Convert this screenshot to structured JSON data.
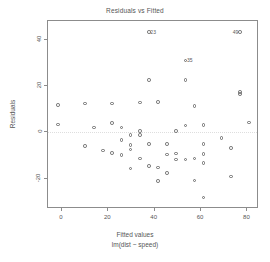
{
  "chart_data": {
    "type": "scatter",
    "title": "Residuals vs Fitted",
    "xlabel_line1": "Fitted values",
    "xlabel_line2": "lm(dist ~ speed)",
    "ylabel": "Residuals",
    "xlim": [
      -6,
      85
    ],
    "ylim": [
      -33,
      48
    ],
    "xticks": [
      0,
      20,
      40,
      60,
      80
    ],
    "yticks": [
      40,
      20,
      0,
      -20
    ],
    "xtick_labels": [
      "0",
      "20",
      "40",
      "60",
      "80"
    ],
    "ytick_labels": [
      "40",
      "20",
      "0",
      "-20"
    ],
    "grid": false,
    "legend": "none",
    "zero_reference_line": 0,
    "marker": "open-circle",
    "marker_color": "#6b6b6b",
    "points": [
      {
        "x": -1.8,
        "y": 11.8
      },
      {
        "x": -1.8,
        "y": 3.4
      },
      {
        "x": 9.9,
        "y": 12.4
      },
      {
        "x": 9.9,
        "y": -5.8
      },
      {
        "x": 13.9,
        "y": 2.1
      },
      {
        "x": 17.8,
        "y": -7.8
      },
      {
        "x": 21.7,
        "y": 12.4
      },
      {
        "x": 21.7,
        "y": 4.0
      },
      {
        "x": 21.7,
        "y": -8.9
      },
      {
        "x": 25.7,
        "y": 2.2
      },
      {
        "x": 25.7,
        "y": -3.2
      },
      {
        "x": 25.7,
        "y": -9.7
      },
      {
        "x": 29.6,
        "y": -1.2
      },
      {
        "x": 29.6,
        "y": -5.5
      },
      {
        "x": 29.6,
        "y": -7.3
      },
      {
        "x": 29.6,
        "y": -15.6
      },
      {
        "x": 33.6,
        "y": 12.8
      },
      {
        "x": 33.6,
        "y": 0.6
      },
      {
        "x": 33.6,
        "y": -1.0
      },
      {
        "x": 33.6,
        "y": -11.3
      },
      {
        "x": 37.5,
        "y": 43.2
      },
      {
        "x": 37.5,
        "y": 22.5
      },
      {
        "x": 37.5,
        "y": -5.1
      },
      {
        "x": 37.5,
        "y": -14.6
      },
      {
        "x": 41.4,
        "y": 13.2
      },
      {
        "x": 41.4,
        "y": -15.1
      },
      {
        "x": 41.4,
        "y": -21.0
      },
      {
        "x": 45.4,
        "y": -5.0
      },
      {
        "x": 45.4,
        "y": -9.5
      },
      {
        "x": 45.4,
        "y": -17.4
      },
      {
        "x": 49.3,
        "y": 0.7
      },
      {
        "x": 49.3,
        "y": -9.1
      },
      {
        "x": 49.3,
        "y": -11.6
      },
      {
        "x": 53.3,
        "y": 31.0
      },
      {
        "x": 53.3,
        "y": 22.6
      },
      {
        "x": 53.3,
        "y": 3.0
      },
      {
        "x": 53.3,
        "y": -11.6
      },
      {
        "x": 57.2,
        "y": 11.4
      },
      {
        "x": 57.2,
        "y": -11.2
      },
      {
        "x": 57.2,
        "y": -20.7
      },
      {
        "x": 61.1,
        "y": 3.2
      },
      {
        "x": 61.1,
        "y": -4.9
      },
      {
        "x": 61.1,
        "y": -9.2
      },
      {
        "x": 61.1,
        "y": -13.2
      },
      {
        "x": 61.1,
        "y": -28.0
      },
      {
        "x": 68.8,
        "y": -2.3
      },
      {
        "x": 72.8,
        "y": -6.6
      },
      {
        "x": 72.8,
        "y": -19.0
      },
      {
        "x": 76.7,
        "y": 16.6
      },
      {
        "x": 76.7,
        "y": 17.4
      },
      {
        "x": 76.7,
        "y": 43.2
      },
      {
        "x": 80.6,
        "y": 4.3
      }
    ],
    "labeled_points": [
      {
        "label": "23",
        "x": 37.5,
        "y": 43.2,
        "side": "right"
      },
      {
        "label": "35",
        "x": 53.3,
        "y": 31.0,
        "side": "right"
      },
      {
        "label": "49",
        "x": 76.7,
        "y": 43.2,
        "side": "left"
      }
    ]
  }
}
